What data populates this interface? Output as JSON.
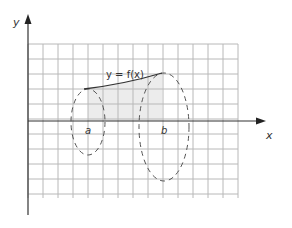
{
  "diagram": {
    "axes": {
      "x_label": "x",
      "y_label": "y"
    },
    "curve_label": "y = f(x)",
    "markers": {
      "a_label": "a",
      "b_label": "b"
    },
    "grid": {
      "x0": 28,
      "x1": 238,
      "y0": 44,
      "y1": 198,
      "step": 15
    },
    "colors": {
      "grid": "#b8b8b8",
      "axis": "#333333",
      "curve": "#333333",
      "ellipse": "#555555",
      "shade": "#ececec"
    }
  }
}
